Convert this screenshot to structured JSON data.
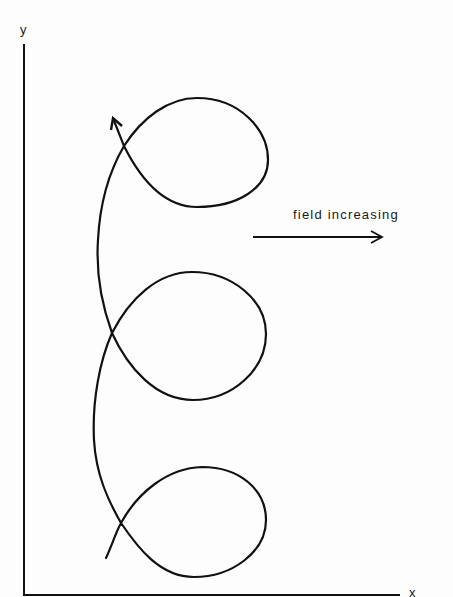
{
  "diagram": {
    "title": "",
    "axes": {
      "x_label": "x",
      "y_label": "y"
    },
    "annotation": {
      "text": "field increasing",
      "direction": "right"
    },
    "curve": {
      "description": "trochoid-like path with three loops drifting in -y direction as it progresses upward",
      "loops": 3,
      "arrow_at_end": true
    },
    "colors": {
      "stroke": "#111111",
      "background": "#fdfdfd"
    }
  }
}
